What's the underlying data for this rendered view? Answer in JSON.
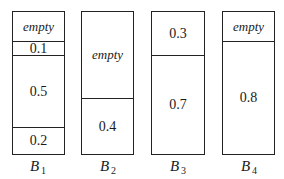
{
  "diagram": {
    "bins": [
      {
        "label": "B",
        "subscript": "1",
        "segments": [
          {
            "text": "empty",
            "kind": "empty",
            "size": 0.2
          },
          {
            "text": "0.1",
            "kind": "item",
            "size": 0.1
          },
          {
            "text": "0.5",
            "kind": "item",
            "size": 0.5
          },
          {
            "text": "0.2",
            "kind": "item",
            "size": 0.2
          }
        ]
      },
      {
        "label": "B",
        "subscript": "2",
        "segments": [
          {
            "text": "empty",
            "kind": "empty",
            "size": 0.6
          },
          {
            "text": "0.4",
            "kind": "item",
            "size": 0.4
          }
        ]
      },
      {
        "label": "B",
        "subscript": "3",
        "segments": [
          {
            "text": "0.3",
            "kind": "item",
            "size": 0.3
          },
          {
            "text": "0.7",
            "kind": "item",
            "size": 0.7
          }
        ]
      },
      {
        "label": "B",
        "subscript": "4",
        "segments": [
          {
            "text": "empty",
            "kind": "empty",
            "size": 0.2
          },
          {
            "text": "0.8",
            "kind": "item",
            "size": 0.8
          }
        ]
      }
    ]
  }
}
